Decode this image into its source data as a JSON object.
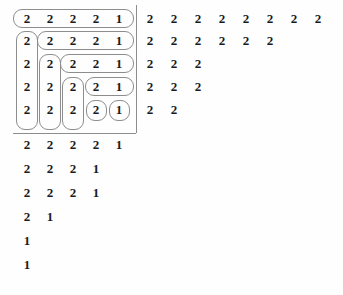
{
  "figure": {
    "background_color": "#fefefe",
    "digit_color": "#1a1a1a",
    "hook_outline_color": "#8d8d8d",
    "rule_color": "#8d8d8d",
    "left_diagram": {
      "name": "hooked-tableau",
      "column_count": 5,
      "row_count": 11,
      "column_x": [
        27,
        50,
        73,
        96,
        119
      ],
      "row_y": [
        18,
        40,
        63,
        86,
        109,
        144,
        168,
        192,
        216,
        240,
        264
      ],
      "rows": [
        [
          "2",
          "2",
          "2",
          "2",
          "1"
        ],
        [
          "2",
          "2",
          "2",
          "2",
          "1"
        ],
        [
          "2",
          "2",
          "2",
          "2",
          "1"
        ],
        [
          "2",
          "2",
          "2",
          "2",
          "1"
        ],
        [
          "2",
          "2",
          "2",
          "2",
          "1"
        ],
        [
          "2",
          "2",
          "2",
          "2",
          "1"
        ],
        [
          "2",
          "2",
          "2",
          "1"
        ],
        [
          "2",
          "2",
          "2",
          "1"
        ],
        [
          "2",
          "1"
        ],
        [
          "1"
        ],
        [
          "1"
        ]
      ],
      "boxed_row_count": 5,
      "hooks": [
        {
          "label": "hook-1-horizontal",
          "x": 13,
          "y": 9,
          "w": 121,
          "h": 19
        },
        {
          "label": "hook-2-arm-column",
          "x": 16,
          "y": 31,
          "w": 22,
          "h": 99
        },
        {
          "label": "hook-2-horizontal",
          "x": 37,
          "y": 31,
          "w": 97,
          "h": 19
        },
        {
          "label": "hook-3-arm-column",
          "x": 39,
          "y": 54,
          "w": 22,
          "h": 76
        },
        {
          "label": "hook-3-horizontal",
          "x": 60,
          "y": 54,
          "w": 74,
          "h": 19
        },
        {
          "label": "hook-4-arm-column",
          "x": 62,
          "y": 77,
          "w": 22,
          "h": 53
        },
        {
          "label": "hook-4-horizontal",
          "x": 85,
          "y": 77,
          "w": 49,
          "h": 19
        },
        {
          "label": "hook-5-single-col4",
          "x": 86,
          "y": 100,
          "w": 21,
          "h": 21
        },
        {
          "label": "hook-5-single-col5",
          "x": 109,
          "y": 100,
          "w": 21,
          "h": 21
        }
      ],
      "rules": [
        {
          "label": "vertical-rule",
          "orientation": "v",
          "x": 136,
          "y": 5,
          "length": 128
        },
        {
          "label": "horizontal-rule",
          "orientation": "h",
          "x": 13,
          "y": 133,
          "length": 123
        }
      ]
    },
    "right_diagram": {
      "name": "conjugate-number-grid",
      "column_x": [
        150,
        174,
        198,
        222,
        246,
        270,
        294,
        318
      ],
      "row_y": [
        18,
        40,
        63,
        86,
        109
      ],
      "rows": [
        [
          "2",
          "2",
          "2",
          "2",
          "2",
          "2",
          "2",
          "2"
        ],
        [
          "2",
          "2",
          "2",
          "2",
          "2",
          "2"
        ],
        [
          "2",
          "2",
          "2"
        ],
        [
          "2",
          "2",
          "2"
        ],
        [
          "2",
          "2"
        ]
      ]
    }
  }
}
